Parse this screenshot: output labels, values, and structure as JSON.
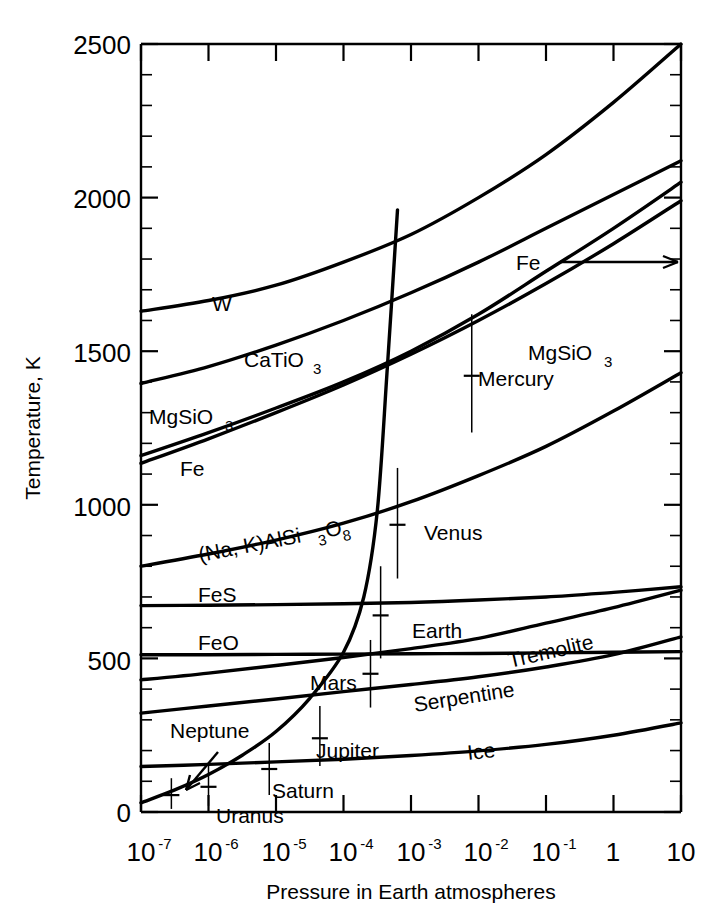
{
  "figure": {
    "axis_title_y": "Temperature, K",
    "axis_title_x": "Pressure in Earth atmospheres",
    "background_color": "#ffffff",
    "line_color": "#000000"
  },
  "y_axis": {
    "ticks": [
      "0",
      "500",
      "1000",
      "1500",
      "2000",
      "2500"
    ],
    "tick_values": [
      0,
      500,
      1000,
      1500,
      2000,
      2500
    ],
    "minor_step": 100,
    "range": [
      0,
      2500
    ]
  },
  "x_axis": {
    "ticks": [
      "10",
      "10",
      "10",
      "10",
      "10",
      "10",
      "10",
      "1",
      "10"
    ],
    "mantissas": [
      "10",
      "10",
      "10",
      "10",
      "10",
      "10",
      "10",
      "1",
      "10"
    ],
    "exponents": [
      "-7",
      "-6",
      "-5",
      "-4",
      "-3",
      "-2",
      "-1",
      "",
      ""
    ],
    "exponent_values": [
      -7,
      -6,
      -5,
      -4,
      -3,
      -2,
      -1,
      0,
      1
    ],
    "range": [
      -7,
      1
    ]
  },
  "curves": [
    {
      "name": "W",
      "label": "W"
    },
    {
      "name": "CaTiO3",
      "label": "CaTiO",
      "sub": "3"
    },
    {
      "name": "MgSiO3-upper",
      "label": "MgSiO",
      "sub": "3"
    },
    {
      "name": "Fe-upper",
      "label": "Fe"
    },
    {
      "name": "MgSiO3-right",
      "label": "MgSiO",
      "sub": "3"
    },
    {
      "name": "Fe-right",
      "label": "Fe"
    },
    {
      "name": "NaKAlSi3O8",
      "label": "(Na, K)AlSi",
      "sub": "3",
      "label2": "O",
      "sub2": "8"
    },
    {
      "name": "FeS",
      "label": "FeS"
    },
    {
      "name": "FeO",
      "label": "FeO"
    },
    {
      "name": "Tremolite",
      "label": "Tremolite"
    },
    {
      "name": "Serpentine",
      "label": "Serpentine"
    },
    {
      "name": "Ice",
      "label": "Ice"
    }
  ],
  "planets": [
    {
      "name": "Mercury",
      "label": "Mercury"
    },
    {
      "name": "Venus",
      "label": "Venus"
    },
    {
      "name": "Earth",
      "label": "Earth"
    },
    {
      "name": "Mars",
      "label": "Mars"
    },
    {
      "name": "Jupiter",
      "label": "Jupiter"
    },
    {
      "name": "Saturn",
      "label": "Saturn"
    },
    {
      "name": "Uranus",
      "label": "Uranus"
    },
    {
      "name": "Neptune",
      "label": "Neptune"
    }
  ],
  "chart_data": {
    "type": "line",
    "title": "",
    "xlabel": "Pressure in Earth atmospheres",
    "ylabel": "Temperature, K",
    "xscale": "log",
    "xlim": [
      1e-07,
      10
    ],
    "ylim": [
      0,
      2500
    ],
    "xticks": [
      1e-07,
      1e-06,
      1e-05,
      0.0001,
      0.001,
      0.01,
      0.1,
      1,
      10
    ],
    "xticklabels": [
      "10^-7",
      "10^-6",
      "10^-5",
      "10^-4",
      "10^-3",
      "10^-2",
      "10^-1",
      "1",
      "10"
    ],
    "yticks": [
      0,
      500,
      1000,
      1500,
      2000,
      2500
    ],
    "yticklabels": [
      "0",
      "500",
      "1000",
      "1500",
      "2000",
      "2500"
    ],
    "grid": false,
    "legend": "none (curves labelled inline)",
    "series": [
      {
        "name": "W",
        "label_text": "W",
        "label_position": {
          "log_p": -5.85,
          "T": 1760
        },
        "x_log": [
          -7,
          -6,
          -5,
          -4,
          -3,
          -2,
          -1,
          0,
          1
        ],
        "y": [
          1630,
          1665,
          1715,
          1790,
          1880,
          2000,
          2140,
          2310,
          2500
        ]
      },
      {
        "name": "CaTiO3",
        "label_text": "CaTiO3",
        "label_position": {
          "log_p": -5.0,
          "T": 1470
        },
        "x_log": [
          -7,
          -6,
          -5,
          -4,
          -3,
          -2,
          -1,
          0,
          1
        ],
        "y": [
          1395,
          1450,
          1520,
          1600,
          1690,
          1790,
          1900,
          2010,
          2120
        ]
      },
      {
        "name": "MgSiO3-upper",
        "label_text": "MgSiO3",
        "label_position": {
          "log_p": -6.9,
          "T": 1270
        },
        "x_log": [
          -7,
          -6,
          -5,
          -4,
          -3,
          -2,
          -1,
          0,
          1
        ],
        "y": [
          1160,
          1235,
          1315,
          1400,
          1500,
          1620,
          1760,
          1900,
          2050
        ]
      },
      {
        "name": "Fe-upper",
        "label_text": "Fe",
        "label_position": {
          "log_p": -6.75,
          "T": 1135
        },
        "x_log": [
          -7,
          -6,
          -5,
          -4,
          -3,
          -2,
          -1,
          0,
          1
        ],
        "y": [
          1135,
          1215,
          1300,
          1390,
          1490,
          1600,
          1720,
          1850,
          1990
        ]
      },
      {
        "name": "MgSiO3-right",
        "label_text": "MgSiO3",
        "label_position": {
          "log_p": -1.55,
          "T": 1520
        },
        "note": "same family label repeated to the right of Mercury"
      },
      {
        "name": "Fe-right-arrow",
        "label_text": "Fe",
        "label_position": {
          "log_p": -2.35,
          "T": 1760
        },
        "note": "label with horizontal leader/arrow pointing right to the curve ending at 1800 K"
      },
      {
        "name": "NaKAlSi3O8",
        "label_text": "(Na, K)AlSi3O8",
        "label_position": {
          "log_p": -6.0,
          "T": 930
        },
        "x_log": [
          -7,
          -6,
          -5,
          -4,
          -3,
          -2,
          -1,
          0,
          1
        ],
        "y": [
          800,
          840,
          885,
          940,
          1010,
          1095,
          1190,
          1305,
          1430
        ]
      },
      {
        "name": "FeS",
        "label_text": "FeS",
        "label_position": {
          "log_p": -6.7,
          "T": 710
        },
        "x_log": [
          -7,
          -6,
          -5,
          -4,
          -3,
          -2,
          -1,
          0,
          1
        ],
        "y": [
          672,
          673,
          675,
          678,
          682,
          690,
          700,
          715,
          733
        ]
      },
      {
        "name": "FeO",
        "label_text": "FeO",
        "label_position": {
          "log_p": -6.7,
          "T": 580
        },
        "x_log": [
          -7,
          -6,
          -5,
          -4,
          -3,
          -2,
          -1,
          0,
          1
        ],
        "y": [
          512,
          512,
          513,
          514,
          515,
          516,
          518,
          520,
          522
        ]
      },
      {
        "name": "Tremolite",
        "label_text": "Tremolite",
        "label_position": {
          "log_p": -1.35,
          "T": 560
        },
        "x_log": [
          -7,
          -6,
          -5,
          -4,
          -3,
          -2,
          -1,
          0,
          1
        ],
        "y": [
          430,
          452,
          477,
          503,
          532,
          565,
          615,
          665,
          722
        ]
      },
      {
        "name": "Serpentine",
        "label_text": "Serpentine",
        "label_position": {
          "log_p": -2.6,
          "T": 400
        },
        "x_log": [
          -7,
          -6,
          -5,
          -4,
          -3,
          -2,
          -1,
          0,
          1
        ],
        "y": [
          322,
          345,
          368,
          392,
          415,
          440,
          472,
          512,
          570
        ]
      },
      {
        "name": "Ice",
        "label_text": "Ice",
        "label_position": {
          "log_p": -1.1,
          "T": 180
        },
        "x_log": [
          -7,
          -6,
          -5,
          -4,
          -3,
          -2,
          -1,
          0,
          1
        ],
        "y": [
          148,
          155,
          163,
          172,
          184,
          199,
          220,
          250,
          290
        ]
      },
      {
        "name": "planetary-adiabat",
        "label_text": "",
        "note": "steep curve through the planet points, rising from ~30 K at 1e-7 atm to ~1960 K near 4e-3 atm",
        "x_log": [
          -7.0,
          -6.5,
          -6.0,
          -5.5,
          -5.0,
          -4.5,
          -4.0,
          -3.7,
          -3.5,
          -3.35,
          -3.2
        ],
        "y": [
          30,
          72,
          122,
          185,
          262,
          370,
          520,
          700,
          980,
          1450,
          1960
        ]
      }
    ],
    "annotations": [
      {
        "name": "Mercury",
        "log_p": -2.1,
        "T": 1420,
        "err_low": 1235,
        "err_high": 1620,
        "label_side": "right"
      },
      {
        "name": "Venus",
        "log_p": -3.2,
        "T": 935,
        "err_low": 760,
        "err_high": 1120,
        "label_side": "right"
      },
      {
        "name": "Earth",
        "log_p": -3.45,
        "T": 640,
        "err_low": 500,
        "err_high": 800,
        "label_side": "right"
      },
      {
        "name": "Mars",
        "log_p": -3.6,
        "T": 450,
        "err_low": 340,
        "err_high": 560,
        "label_side": "right"
      },
      {
        "name": "Jupiter",
        "log_p": -4.35,
        "T": 240,
        "err_low": 150,
        "err_high": 345,
        "label_side": "right"
      },
      {
        "name": "Saturn",
        "log_p": -5.1,
        "T": 140,
        "err_low": 55,
        "err_high": 225,
        "label_side": "right"
      },
      {
        "name": "Uranus",
        "log_p": -6.0,
        "T": 82,
        "err_low": 20,
        "err_high": 150,
        "label_side": "right"
      },
      {
        "name": "Neptune",
        "log_p": -6.55,
        "T": 55,
        "err_low": 10,
        "err_high": 110,
        "label_side": "arrow-from-upper-right"
      }
    ]
  }
}
